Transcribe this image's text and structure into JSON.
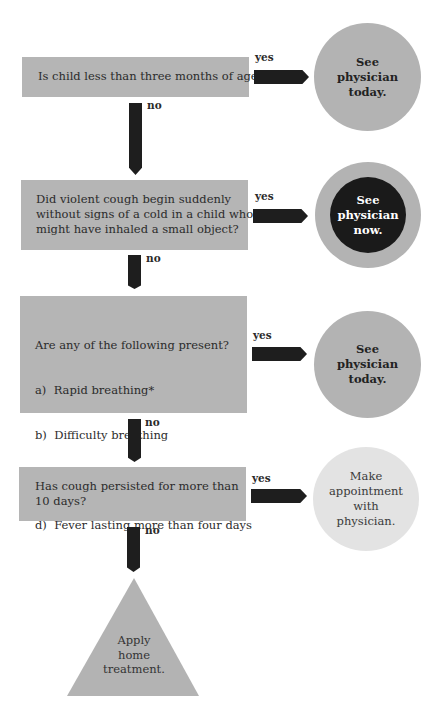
{
  "flowchart": {
    "steps": [
      {
        "question": [
          "Is child less than three months of age?"
        ],
        "yes_label": "yes",
        "no_label": "no",
        "outcome": [
          "See",
          "physician",
          "today."
        ]
      },
      {
        "question": [
          "Did violent cough begin suddenly",
          "without signs of a cold in a child who",
          "might have inhaled a small object?"
        ],
        "yes_label": "yes",
        "no_label": "no",
        "outcome": [
          "See",
          "physician",
          "now."
        ]
      },
      {
        "question": [
          "Are any of the following present?",
          "a)  Rapid breathing*",
          "b)  Difficulty breathing",
          "c)  Wheezing",
          "d)  Fever lasting more than four days"
        ],
        "yes_label": "yes",
        "no_label": "no",
        "outcome": [
          "See",
          "physician",
          "today."
        ]
      },
      {
        "question": [
          "Has cough persisted for more than",
          "10 days?"
        ],
        "yes_label": "yes",
        "no_label": "no",
        "outcome": [
          "Make",
          "appointment",
          "with",
          "physician."
        ]
      }
    ],
    "final": [
      "Apply",
      "home",
      "treatment."
    ]
  },
  "colors": {
    "box": "#b5b5b5",
    "arrow": "#1e1e1e",
    "circle_mid": "#b3b3b3",
    "circle_urgent_inner": "#1a1a1a",
    "circle_light": "#e3e3e3",
    "triangle": "#b3b3b3"
  }
}
